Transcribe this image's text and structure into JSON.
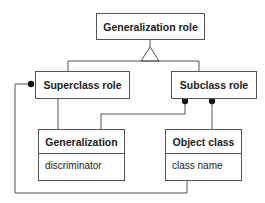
{
  "diagram": {
    "type": "UML class diagram",
    "nodes": {
      "generalization_role": {
        "title": "Generalization role"
      },
      "superclass_role": {
        "title": "Superclass role"
      },
      "subclass_role": {
        "title": "Subclass role"
      },
      "generalization": {
        "title": "Generalization",
        "attributes": [
          "discriminator"
        ]
      },
      "object_class": {
        "title": "Object class",
        "attributes": [
          "class name"
        ]
      }
    },
    "edges": [
      {
        "from": "superclass_role",
        "to": "generalization_role",
        "type": "generalization"
      },
      {
        "from": "subclass_role",
        "to": "generalization_role",
        "type": "generalization"
      },
      {
        "from": "generalization",
        "to": "superclass_role",
        "type": "association"
      },
      {
        "from": "generalization",
        "to": "subclass_role",
        "type": "association-many"
      },
      {
        "from": "object_class",
        "to": "subclass_role",
        "type": "association-many"
      },
      {
        "from": "object_class",
        "to": "superclass_role",
        "type": "association-many"
      }
    ],
    "colors": {
      "line": "#555555",
      "text": "#222222",
      "background": "#ffffff"
    }
  }
}
